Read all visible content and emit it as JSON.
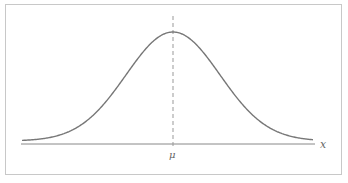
{
  "chart_data": {
    "type": "line",
    "title": "",
    "xlabel": "x",
    "ylabel": "",
    "x_tick_labels": [
      "μ"
    ],
    "series": [
      {
        "name": "normal distribution density",
        "distribution": "normal",
        "mean_label": "μ",
        "x": [
          -3,
          -2.5,
          -2,
          -1.5,
          -1,
          -0.5,
          0,
          0.5,
          1,
          1.5,
          2,
          2.5,
          3
        ],
        "values": [
          0.011,
          0.044,
          0.135,
          0.325,
          0.607,
          0.882,
          1.0,
          0.882,
          0.607,
          0.325,
          0.135,
          0.044,
          0.011
        ]
      }
    ],
    "annotations": [
      {
        "type": "vertical-dashed-line",
        "at": "μ"
      }
    ],
    "grid": false,
    "legend": "none",
    "colors": {
      "curve": "#777777",
      "axis": "#888888",
      "mean_line": "#999999",
      "border": "#c8c8c8"
    }
  },
  "labels": {
    "x_axis": "x",
    "mean": "μ"
  }
}
